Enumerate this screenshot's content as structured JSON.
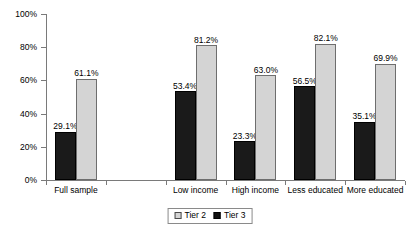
{
  "chart_data": {
    "type": "bar",
    "title": "",
    "subtitle": "",
    "xlabel": "",
    "ylabel": "",
    "ylim": [
      0,
      100
    ],
    "yticks": [
      "0%",
      "20%",
      "40%",
      "60%",
      "80%",
      "100%"
    ],
    "ytick_values": [
      0,
      20,
      40,
      60,
      80,
      100
    ],
    "grid": false,
    "legend_position": "bottom-center",
    "categories": [
      "Full sample",
      "",
      "Low income",
      "High income",
      "Less educated",
      "More educated"
    ],
    "series": [
      {
        "name": "Tier 3",
        "color": "#1a1a1a",
        "values": [
          29.1,
          null,
          53.4,
          23.3,
          56.5,
          35.1
        ],
        "labels": [
          "29.1%",
          "",
          "53.4%",
          "23.3%",
          "56.5%",
          "35.1%"
        ]
      },
      {
        "name": "Tier 2",
        "color": "#d4d4d4",
        "values": [
          61.1,
          null,
          81.2,
          63.0,
          82.1,
          69.9
        ],
        "labels": [
          "61.1%",
          "",
          "81.2%",
          "63.0%",
          "82.1%",
          "69.9%"
        ]
      }
    ],
    "legend": [
      {
        "label": "Tier 2",
        "swatch": "tier2"
      },
      {
        "label": "Tier 3",
        "swatch": "tier3"
      }
    ]
  }
}
